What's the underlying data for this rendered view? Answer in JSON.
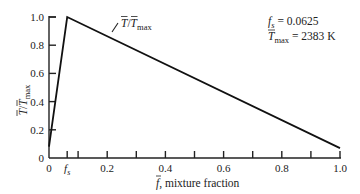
{
  "chart_data": {
    "type": "line",
    "title": "",
    "xlabel": "f̄, mixture fraction",
    "ylabel": "T̄/T̄max",
    "xlim": [
      0,
      1.0
    ],
    "ylim": [
      0,
      1.0
    ],
    "grid": false,
    "x_ticks": [
      0,
      0.0625,
      0.1,
      0.2,
      0.3,
      0.4,
      0.5,
      0.6,
      0.7,
      0.8,
      0.9,
      1.0
    ],
    "x_tick_labels": [
      {
        "value": 0,
        "label": "0"
      },
      {
        "value": 0.0625,
        "label": "fs"
      },
      {
        "value": 0.2,
        "label": "0.2"
      },
      {
        "value": 0.4,
        "label": "0.4"
      },
      {
        "value": 0.6,
        "label": "0.6"
      },
      {
        "value": 0.8,
        "label": "0.8"
      },
      {
        "value": 1.0,
        "label": "1.0"
      }
    ],
    "y_ticks": [
      0,
      0.2,
      0.4,
      0.6,
      0.8,
      1.0
    ],
    "y_tick_labels": [
      "0",
      "0.2",
      "0.4",
      "0.6",
      "0.8",
      "1.0"
    ],
    "series": [
      {
        "name": "T̄/T̄max",
        "x": [
          0,
          0.0625,
          1.0
        ],
        "y": [
          0.08,
          1.0,
          0.07
        ]
      }
    ],
    "annotations": [
      {
        "text": "T̄/T̄max",
        "type": "curve-label",
        "near_x": 0.3,
        "near_y": 0.93
      },
      {
        "text": "fs = 0.0625",
        "type": "parameter"
      },
      {
        "text": "T̄max = 2383 K",
        "type": "parameter"
      }
    ],
    "legend": "none"
  },
  "labels": {
    "x_axis_main": ", mixture fraction",
    "x_axis_symbol": "f",
    "y_axis_symbol_num": "T",
    "y_axis_symbol_den": "T",
    "y_axis_sub": "max",
    "curve_label_num": "T",
    "curve_label_den": "T",
    "curve_label_sub": "max",
    "fs_symbol": "f",
    "fs_sub": "s",
    "fs_value": " = 0.0625",
    "tmax_symbol": "T",
    "tmax_sub": "max",
    "tmax_value": " = 2383 K"
  }
}
